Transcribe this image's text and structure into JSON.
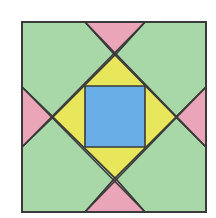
{
  "figure": {
    "type": "quilt-block-geometric-diagram",
    "outer_square": {
      "x1": 22,
      "y1": 22,
      "x2": 206,
      "y2": 212
    },
    "colors": {
      "background": "#ffffff",
      "green": "#a8d8a8",
      "pink": "#eaa6b8",
      "yellow": "#e8e65a",
      "blue": "#6aaee8",
      "stroke": "#3a3a3a"
    },
    "regions": [
      {
        "name": "green-corner-top-left",
        "color": "green",
        "points": "22,22 85,22 115,55 53,117 22,87"
      },
      {
        "name": "green-corner-top-right",
        "color": "green",
        "points": "145,22 206,22 206,87 176,117 115,55"
      },
      {
        "name": "green-corner-bottom-right",
        "color": "green",
        "points": "206,147 206,212 145,212 115,178 176,117"
      },
      {
        "name": "green-corner-bottom-left",
        "color": "green",
        "points": "22,147 53,117 115,178 85,212 22,212"
      },
      {
        "name": "pink-triangle-top",
        "color": "pink",
        "points": "85,22 145,22 115,55"
      },
      {
        "name": "pink-triangle-right",
        "color": "pink",
        "points": "206,87 206,147 176,117"
      },
      {
        "name": "pink-triangle-bottom",
        "color": "pink",
        "points": "85,212 145,212 115,178"
      },
      {
        "name": "pink-triangle-left",
        "color": "pink",
        "points": "22,87 53,117 22,147"
      },
      {
        "name": "yellow-diamond",
        "color": "yellow",
        "points": "115,55 176,117 115,178 53,117"
      },
      {
        "name": "blue-center-square",
        "color": "blue",
        "points": "85,86 145,86 145,147 85,147"
      }
    ],
    "lines": [
      {
        "name": "diagonal-line-1",
        "x1": 85,
        "y1": 22,
        "x2": 206,
        "y2": 147
      },
      {
        "name": "diagonal-line-2",
        "x1": 145,
        "y1": 22,
        "x2": 22,
        "y2": 147
      },
      {
        "name": "diagonal-line-3",
        "x1": 22,
        "y1": 87,
        "x2": 145,
        "y2": 212
      },
      {
        "name": "diagonal-line-4",
        "x1": 206,
        "y1": 87,
        "x2": 85,
        "y2": 212
      }
    ]
  }
}
